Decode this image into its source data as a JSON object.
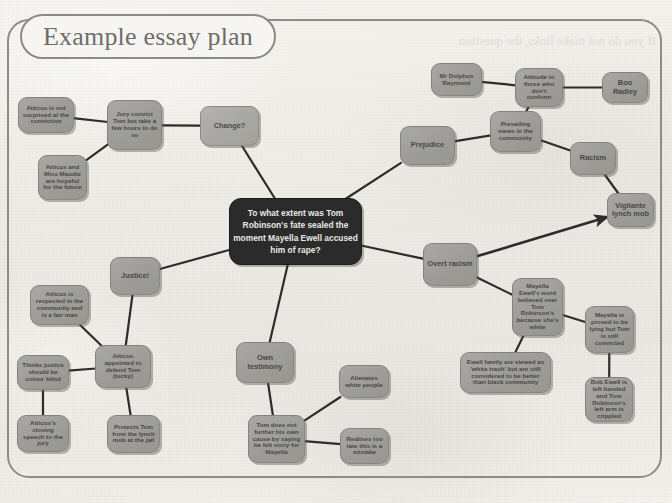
{
  "page": {
    "title": "Example essay plan",
    "bleed_through_text": "If you do not make links, the question",
    "background_color": "#efeee9",
    "frame_color": "#8d8c88",
    "node_color": "#a2a19d",
    "central_node_color": "#2b2b2b",
    "edge_color": "#2e2d2b"
  },
  "central": {
    "id": "central-question",
    "text": "To what extent was Tom Robinson's fate sealed the moment Mayella Ewell accused him of rape?"
  },
  "nodes": [
    {
      "id": "change",
      "label": "Change?",
      "tone": "greylight"
    },
    {
      "id": "jury-convict",
      "label": "Jury convict Tom but take a few hours to do so",
      "tone": "grey"
    },
    {
      "id": "atticus-not-surprised",
      "label": "Atticus is not surprised at the conviction",
      "tone": "grey"
    },
    {
      "id": "atticus-maudie-hopeful",
      "label": "Atticus and Miss Maudie are hopeful for the future",
      "tone": "grey"
    },
    {
      "id": "prejudice",
      "label": "Prejudice",
      "tone": "grey"
    },
    {
      "id": "prevailing-views",
      "label": "Prevailing views in the community",
      "tone": "grey"
    },
    {
      "id": "attitude-nonconform",
      "label": "Attitude to those who don't conform",
      "tone": "grey"
    },
    {
      "id": "mr-dolphus-raymond",
      "label": "Mr Dolphus Raymond",
      "tone": "grey"
    },
    {
      "id": "boo-radley",
      "label": "Boo Radley",
      "tone": "grey"
    },
    {
      "id": "racism",
      "label": "Racism",
      "tone": "grey"
    },
    {
      "id": "overt-racism",
      "label": "Overt racism",
      "tone": "grey"
    },
    {
      "id": "vigilante-lynch-mob",
      "label": "Vigilante lynch mob",
      "tone": "grey"
    },
    {
      "id": "mayella-word-believed",
      "label": "Mayella Ewell's word believed over Tom Robinson's because she's white",
      "tone": "grey"
    },
    {
      "id": "mayella-proved-lying",
      "label": "Mayella is proved to be lying but Tom is still convicted",
      "tone": "grey"
    },
    {
      "id": "ewell-white-trash",
      "label": "Ewell family are viewed as 'white trash' but are still considered to be better than black community",
      "tone": "grey"
    },
    {
      "id": "bob-ewell-left-handed",
      "label": "Bob Ewell is left handed and Tom Robinson's left arm is crippled",
      "tone": "grey"
    },
    {
      "id": "justice",
      "label": "Justice!",
      "tone": "grey"
    },
    {
      "id": "atticus-appointed",
      "label": "Atticus appointed to defend Tom (lucky)",
      "tone": "grey"
    },
    {
      "id": "atticus-respected",
      "label": "Atticus is respected in the community and is a fair man",
      "tone": "grey"
    },
    {
      "id": "justice-colour-blind",
      "label": "Thinks justice should be colour blind",
      "tone": "grey"
    },
    {
      "id": "closing-speech",
      "label": "Atticus's closing speech to the jury",
      "tone": "grey"
    },
    {
      "id": "protects-tom",
      "label": "Protects Tom from the lynch mob at the jail",
      "tone": "grey"
    },
    {
      "id": "own-testimony",
      "label": "Own testimony",
      "tone": "grey"
    },
    {
      "id": "tom-felt-sorry",
      "label": "Tom does not further his own cause by saying he felt sorry for Mayella",
      "tone": "grey"
    },
    {
      "id": "alienates-white",
      "label": "Alienates white people",
      "tone": "grey"
    },
    {
      "id": "realises-mistake",
      "label": "Realises too late this is a mistake",
      "tone": "grey"
    }
  ],
  "edges": [
    {
      "from": "central-question",
      "to": "change",
      "arrow": false
    },
    {
      "from": "change",
      "to": "jury-convict",
      "arrow": false
    },
    {
      "from": "jury-convict",
      "to": "atticus-not-surprised",
      "arrow": false
    },
    {
      "from": "jury-convict",
      "to": "atticus-maudie-hopeful",
      "arrow": false
    },
    {
      "from": "central-question",
      "to": "prejudice",
      "arrow": false
    },
    {
      "from": "prejudice",
      "to": "prevailing-views",
      "arrow": false
    },
    {
      "from": "prevailing-views",
      "to": "attitude-nonconform",
      "arrow": false
    },
    {
      "from": "attitude-nonconform",
      "to": "mr-dolphus-raymond",
      "arrow": false
    },
    {
      "from": "attitude-nonconform",
      "to": "boo-radley",
      "arrow": false
    },
    {
      "from": "prevailing-views",
      "to": "racism",
      "arrow": false
    },
    {
      "from": "racism",
      "to": "vigilante-lynch-mob",
      "arrow": false
    },
    {
      "from": "central-question",
      "to": "overt-racism",
      "arrow": false
    },
    {
      "from": "overt-racism",
      "to": "vigilante-lynch-mob",
      "arrow": true
    },
    {
      "from": "overt-racism",
      "to": "mayella-word-believed",
      "arrow": false
    },
    {
      "from": "mayella-word-believed",
      "to": "mayella-proved-lying",
      "arrow": false
    },
    {
      "from": "mayella-word-believed",
      "to": "ewell-white-trash",
      "arrow": false
    },
    {
      "from": "mayella-proved-lying",
      "to": "bob-ewell-left-handed",
      "arrow": false
    },
    {
      "from": "central-question",
      "to": "justice",
      "arrow": false
    },
    {
      "from": "justice",
      "to": "atticus-appointed",
      "arrow": false
    },
    {
      "from": "atticus-appointed",
      "to": "atticus-respected",
      "arrow": false
    },
    {
      "from": "atticus-appointed",
      "to": "justice-colour-blind",
      "arrow": false
    },
    {
      "from": "justice-colour-blind",
      "to": "closing-speech",
      "arrow": false
    },
    {
      "from": "atticus-appointed",
      "to": "protects-tom",
      "arrow": false
    },
    {
      "from": "central-question",
      "to": "own-testimony",
      "arrow": false
    },
    {
      "from": "own-testimony",
      "to": "tom-felt-sorry",
      "arrow": false
    },
    {
      "from": "tom-felt-sorry",
      "to": "alienates-white",
      "arrow": false
    },
    {
      "from": "tom-felt-sorry",
      "to": "realises-mistake",
      "arrow": false
    }
  ]
}
